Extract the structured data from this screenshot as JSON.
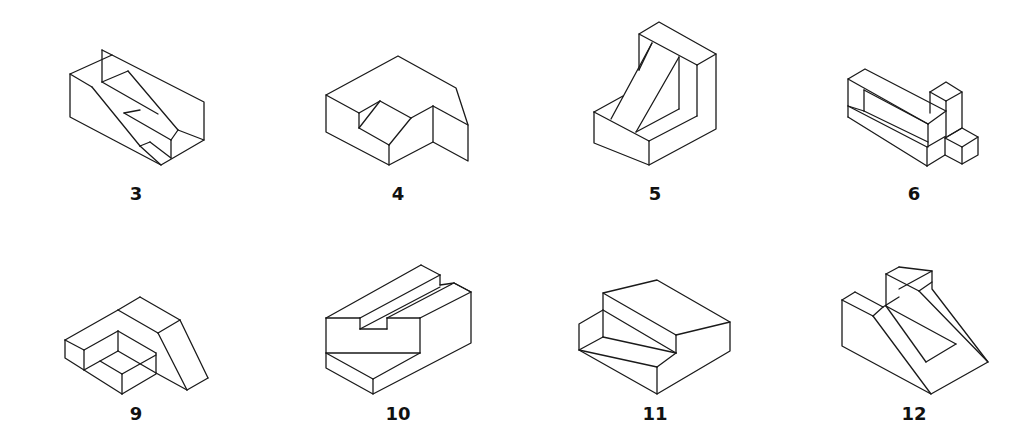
{
  "figures": [
    {
      "id": "3",
      "label": "3",
      "description": "block with diagonal slot groove"
    },
    {
      "id": "4",
      "label": "4",
      "description": "block with notched V cut and step"
    },
    {
      "id": "5",
      "label": "5",
      "description": "L-shaped bracket with inclined rib"
    },
    {
      "id": "6",
      "label": "6",
      "description": "rectangular frame with cube attachments"
    },
    {
      "id": "9",
      "label": "9",
      "description": "block with rectangular pocket and slanted end"
    },
    {
      "id": "10",
      "label": "10",
      "description": "block with T-slot groove"
    },
    {
      "id": "11",
      "label": "11",
      "description": "stepped block"
    },
    {
      "id": "12",
      "label": "12",
      "description": "V-notched wedge block"
    }
  ],
  "colors": {
    "line": "#1a1a1a",
    "background": "#ffffff"
  }
}
